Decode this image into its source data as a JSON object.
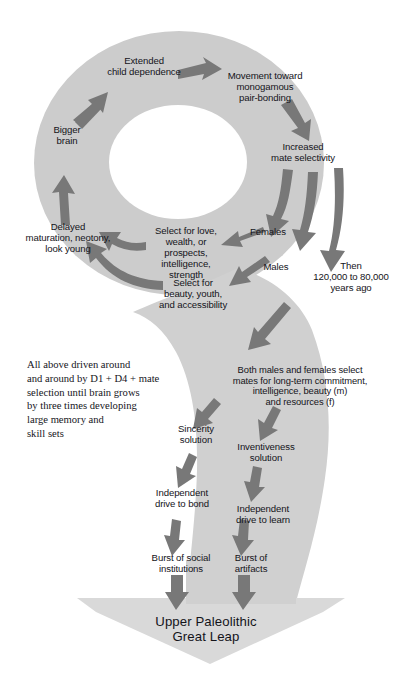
{
  "diagram": {
    "colors": {
      "band": "#cccccc",
      "band_light": "#d2d2d2",
      "arrow": "#777777",
      "text": "#15151b",
      "background": "#ffffff",
      "hole": "#ffffff"
    },
    "cycle_labels": [
      {
        "id": "extended-child-dependence",
        "text": "Extended\nchild dependence"
      },
      {
        "id": "movement-toward-monogamous-pair-bonding",
        "text": "Movement toward\nmonogamous\npair-bonding"
      },
      {
        "id": "increased-mate-selectivity",
        "text": "Increased\nmate selectivity"
      },
      {
        "id": "females",
        "text": "Females"
      },
      {
        "id": "males",
        "text": "Males"
      },
      {
        "id": "then-years-ago",
        "text": "Then\n120,000 to 80,000\nyears ago"
      },
      {
        "id": "select-for-love",
        "text": "Select for love,\nwealth, or\nprospects,\nintelligence,\nstrength"
      },
      {
        "id": "select-for-beauty",
        "text": "Select for\nbeauty, youth,\nand accessibility"
      },
      {
        "id": "delayed-maturation",
        "text": "Delayed\nmaturation, neotony,\nlook young"
      },
      {
        "id": "bigger-brain",
        "text": "Bigger\nbrain"
      }
    ],
    "side_note": "All above driven around\nand around by D1 + D4 + mate\nselection until brain grows\nby three times developing\nlarge memory and\nskill sets",
    "stem_labels": [
      {
        "id": "both-males-and-females-select",
        "text": "Both males and females select\nmates for long-term commitment,\nintelligence, beauty (m)\nand resources (f)"
      },
      {
        "id": "sincerity-solution",
        "text": "Sincerity\nsolution"
      },
      {
        "id": "inventiveness-solution",
        "text": "Inventiveness\nsolution"
      },
      {
        "id": "independent-drive-to-bond",
        "text": "Independent\ndrive to bond"
      },
      {
        "id": "independent-drive-to-learn",
        "text": "Independent\ndrive to learn"
      },
      {
        "id": "burst-of-social-institutions",
        "text": "Burst of social\ninstitutions"
      },
      {
        "id": "burst-of-artifacts",
        "text": "Burst of\nartifacts"
      }
    ],
    "outcome": "Upper Paleolithic\nGreat Leap"
  }
}
